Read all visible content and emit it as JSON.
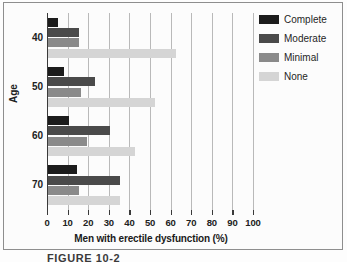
{
  "figure": {
    "caption": "FIGURE 10-2"
  },
  "legend": {
    "position": "top-right",
    "entries": [
      {
        "label": "Complete",
        "color": "#1c1c1c",
        "key": "complete"
      },
      {
        "label": "Moderate",
        "color": "#4a4a4a",
        "key": "moderate"
      },
      {
        "label": "Minimal",
        "color": "#8a8a8a",
        "key": "minimal"
      },
      {
        "label": "None",
        "color": "#d5d5d5",
        "key": "none"
      }
    ]
  },
  "axes": {
    "x_title": "Men with erectile dysfunction (%)",
    "y_title": "Age",
    "x_ticks": [
      "0",
      "10",
      "20",
      "30",
      "40",
      "50",
      "60",
      "70",
      "80",
      "90",
      "100"
    ],
    "y_ticks": [
      "40",
      "50",
      "60",
      "70"
    ]
  },
  "chart_data": {
    "type": "bar",
    "orientation": "horizontal",
    "title": "",
    "xlabel": "Men with erectile dysfunction (%)",
    "ylabel": "Age",
    "categories": [
      "40",
      "50",
      "60",
      "70"
    ],
    "xlim": [
      0,
      100
    ],
    "xtick_step": 10,
    "grid": "vertical",
    "legend_position": "top-right",
    "series": [
      {
        "name": "Complete",
        "color": "#1c1c1c",
        "values": [
          5,
          8,
          10,
          14
        ]
      },
      {
        "name": "Moderate",
        "color": "#4a4a4a",
        "values": [
          15,
          23,
          30,
          35
        ]
      },
      {
        "name": "Minimal",
        "color": "#8a8a8a",
        "values": [
          15,
          16,
          19,
          15
        ]
      },
      {
        "name": "None",
        "color": "#d5d5d5",
        "values": [
          62,
          52,
          42,
          35
        ]
      }
    ]
  }
}
